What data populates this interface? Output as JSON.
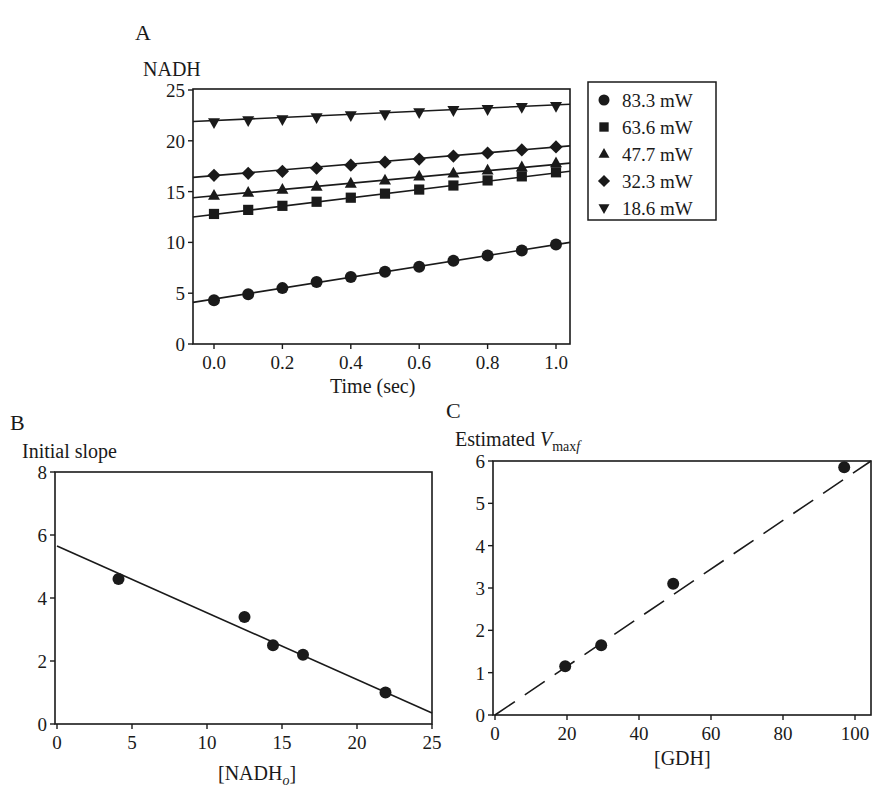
{
  "chart_data": [
    {
      "panel": "A",
      "type": "scatter",
      "title": "",
      "xlabel": "Time (sec)",
      "ylabel": "NADH",
      "xlim": [
        -0.05,
        1.05
      ],
      "ylim": [
        0,
        25
      ],
      "xticks": [
        "0.0",
        "0.2",
        "0.4",
        "0.6",
        "0.8",
        "1.0"
      ],
      "yticks": [
        "0",
        "5",
        "10",
        "15",
        "20",
        "25"
      ],
      "grid": false,
      "legend_position": "right-outside",
      "x": [
        0.0,
        0.1,
        0.2,
        0.3,
        0.4,
        0.5,
        0.6,
        0.7,
        0.8,
        0.9,
        1.0
      ],
      "series": [
        {
          "name": "83.3 mW",
          "marker": "circle",
          "values": [
            4.3,
            4.9,
            5.5,
            6.1,
            6.6,
            7.1,
            7.6,
            8.2,
            8.7,
            9.2,
            9.8
          ],
          "fit": [
            4.1,
            10.0
          ]
        },
        {
          "name": "63.6 mW",
          "marker": "square",
          "values": [
            12.8,
            13.2,
            13.6,
            14.0,
            14.4,
            14.8,
            15.2,
            15.6,
            16.1,
            16.5,
            16.9
          ],
          "fit": [
            12.5,
            17.0
          ]
        },
        {
          "name": "47.7 mW",
          "marker": "triangle-up",
          "values": [
            14.6,
            14.9,
            15.2,
            15.5,
            15.8,
            16.1,
            16.5,
            16.8,
            17.1,
            17.4,
            17.8
          ],
          "fit": [
            14.4,
            17.8
          ]
        },
        {
          "name": "32.3 mW",
          "marker": "diamond",
          "values": [
            16.6,
            16.8,
            17.0,
            17.3,
            17.6,
            17.9,
            18.2,
            18.5,
            18.8,
            19.1,
            19.4
          ],
          "fit": [
            16.4,
            19.5
          ]
        },
        {
          "name": "18.6 mW",
          "marker": "triangle-down",
          "values": [
            21.8,
            22.0,
            22.1,
            22.3,
            22.5,
            22.6,
            22.8,
            23.0,
            23.1,
            23.3,
            23.4
          ],
          "fit": [
            21.9,
            23.6
          ]
        }
      ]
    },
    {
      "panel": "B",
      "type": "scatter",
      "title": "",
      "xlabel": "[NADHo]",
      "xlabel_main": "[NADH",
      "xlabel_sub": "o",
      "xlabel_close": "]",
      "ylabel": "Initial slope",
      "xlim": [
        0,
        25
      ],
      "ylim": [
        0,
        8
      ],
      "xticks": [
        "0",
        "5",
        "10",
        "15",
        "20",
        "25"
      ],
      "yticks": [
        "0",
        "2",
        "4",
        "6",
        "8"
      ],
      "grid": false,
      "x": [
        4.1,
        12.5,
        14.4,
        16.4,
        21.9
      ],
      "values": [
        4.6,
        3.4,
        2.5,
        2.2,
        1.0
      ],
      "fit_line": {
        "x": [
          0,
          25
        ],
        "y": [
          5.65,
          0.35
        ],
        "style": "solid"
      }
    },
    {
      "panel": "C",
      "type": "scatter",
      "title": "",
      "xlabel": "[GDH]",
      "ylabel": "Estimated Vmaxf",
      "ylabel_main": "Estimated ",
      "ylabel_italic": "V",
      "ylabel_sub": "max",
      "ylabel_sub_italic": "f",
      "xlim": [
        0,
        105
      ],
      "ylim": [
        0,
        6
      ],
      "xticks": [
        "0",
        "20",
        "40",
        "60",
        "80",
        "100"
      ],
      "yticks": [
        "0",
        "1",
        "2",
        "3",
        "4",
        "5",
        "6"
      ],
      "grid": false,
      "x": [
        19.5,
        29.5,
        49.5,
        97
      ],
      "values": [
        1.15,
        1.65,
        3.1,
        5.85
      ],
      "fit_line": {
        "x": [
          0,
          103
        ],
        "y": [
          0,
          6.1
        ],
        "style": "dashed"
      }
    }
  ],
  "panels": {
    "a": {
      "letter": "A",
      "ylabel": "NADH",
      "xlabel": "Time (sec)"
    },
    "b": {
      "letter": "B",
      "ylabel": "Initial slope"
    },
    "c": {
      "letter": "C",
      "ylabel_prefix": "Estimated ",
      "xlabel": "[GDH]"
    }
  },
  "colors": {
    "ink": "#1a1a1a",
    "background": "#ffffff"
  }
}
